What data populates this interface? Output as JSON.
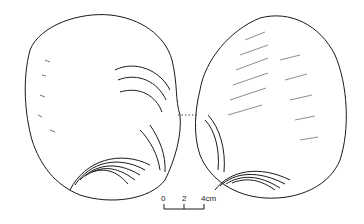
{
  "figure": {
    "views": [
      "left-view",
      "right-view"
    ],
    "ink_color": "#1a1a1a",
    "background": "#ffffff"
  },
  "scale_bar": {
    "ticks": [
      "0",
      "2",
      "4cm"
    ]
  }
}
